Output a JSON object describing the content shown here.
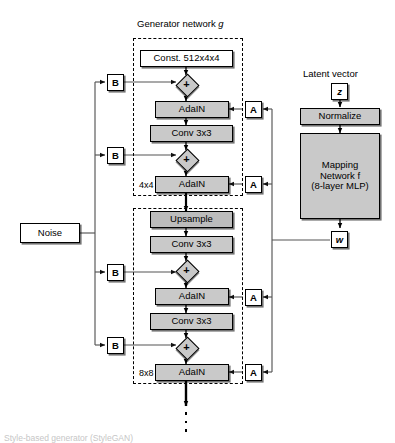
{
  "figure": {
    "title": "Generator network g",
    "title_plain": "Generator network",
    "title_italic": "g",
    "bottom_caption": "Style-based generator (StyleGAN)"
  },
  "colors": {
    "box_gray": "#c9c9c9",
    "box_white": "#ffffff",
    "stroke": "#000000",
    "wire": "#555555"
  },
  "noise": {
    "label": "Noise",
    "branch_label": "B",
    "branches": [
      "B",
      "B",
      "B",
      "B"
    ]
  },
  "mapping": {
    "latent_caption": "Latent vector",
    "latent_token": "z",
    "normalize": "Normalize",
    "network_line1": "Mapping",
    "network_line2": "Network f",
    "network_line3": "(8-layer MLP)",
    "network_name": "Mapping Network f (8-layer MLP)",
    "output_token": "w",
    "style_label": "A",
    "style_branches": [
      "A",
      "A",
      "A",
      "A"
    ]
  },
  "generator": {
    "const_block": "Const. 512x4x4",
    "plus_symbol": "+",
    "blocks": [
      {
        "resolution": "4x4",
        "layers": [
          "Const. 512x4x4",
          "AdaIN",
          "Conv 3x3",
          "AdaIN"
        ]
      },
      {
        "resolution": "8x8",
        "layers": [
          "Upsample",
          "Conv 3x3",
          "AdaIN",
          "Conv 3x3",
          "AdaIN"
        ]
      }
    ],
    "layer_names": {
      "adain": "AdaIN",
      "conv": "Conv 3x3",
      "upsample": "Upsample",
      "const": "Const. 512x4x4"
    }
  },
  "continuation": "vertical-ellipsis"
}
